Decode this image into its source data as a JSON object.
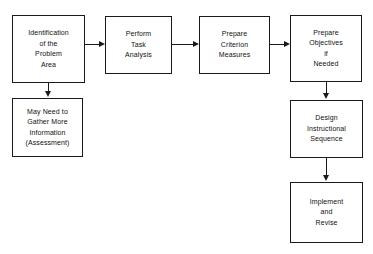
{
  "diagram": {
    "background_color": "#ffffff",
    "line_color": "#1a1a1a",
    "nodes": [
      {
        "id": "identification",
        "label": "Identification\nof the\nProblem\nArea",
        "x": 12,
        "y": 15,
        "width": 73,
        "height": 68
      },
      {
        "id": "may-need",
        "label": "May Need to\nGather More\nInformation\n(Assessment)",
        "x": 12,
        "y": 98,
        "width": 71,
        "height": 59
      },
      {
        "id": "perform-task",
        "label": "Perform\nTask\nAnalysis",
        "x": 105,
        "y": 16,
        "width": 67,
        "height": 58
      },
      {
        "id": "prepare-criterion",
        "label": "Prepare\nCriterion\nMeasures",
        "x": 199,
        "y": 16,
        "width": 71,
        "height": 58
      },
      {
        "id": "prepare-objectives",
        "label": "Prepare\nObjectives\nif\nNeeded",
        "x": 290,
        "y": 15,
        "width": 72,
        "height": 67
      },
      {
        "id": "design-sequence",
        "label": "Design\nInstructional\nSequence",
        "x": 290,
        "y": 100,
        "width": 73,
        "height": 58
      },
      {
        "id": "implement-revise",
        "label": "Implement\nand\nRevise",
        "x": 290,
        "y": 182,
        "width": 73,
        "height": 61
      }
    ],
    "edges": [
      {
        "id": "identification-to-perform-task",
        "direction": "right"
      },
      {
        "id": "identification-to-may-need",
        "direction": "down"
      },
      {
        "id": "perform-task-to-prepare-criterion",
        "direction": "right"
      },
      {
        "id": "prepare-criterion-to-prepare-objectives",
        "direction": "right"
      },
      {
        "id": "prepare-objectives-to-design-sequence",
        "direction": "down"
      },
      {
        "id": "design-sequence-to-implement-revise",
        "direction": "down"
      }
    ]
  }
}
